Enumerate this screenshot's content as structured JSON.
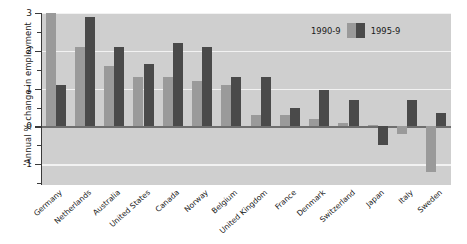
{
  "chart_data": {
    "type": "bar",
    "title": "",
    "xlabel": "",
    "ylabel": "Annual % change in employment",
    "ylim": [
      -1.55,
      3.0
    ],
    "yticks": [
      3,
      2,
      1,
      0,
      -1
    ],
    "ytick_labels": [
      "3",
      "2",
      "1",
      "0",
      "-1"
    ],
    "minor_ticks": [
      2.5,
      1.5,
      0.5,
      -0.5,
      -1.5
    ],
    "grid": true,
    "grid_axis": "y",
    "legend_position": "top-right",
    "categories": [
      "Germany",
      "Netherlands",
      "Australia",
      "United States",
      "Canada",
      "Norway",
      "Belgium",
      "United Kingdom",
      "France",
      "Denmark",
      "Switzerland",
      "Japan",
      "Italy",
      "Sweden"
    ],
    "series": [
      {
        "name": "1990-9",
        "color": "#9a9a9a",
        "values": [
          3.0,
          2.1,
          1.6,
          1.3,
          1.3,
          1.2,
          1.1,
          0.3,
          0.3,
          0.2,
          0.1,
          0.05,
          -0.2,
          -1.2
        ]
      },
      {
        "name": "1995-9",
        "color": "#4a4a4a",
        "values": [
          1.1,
          2.9,
          2.1,
          1.65,
          2.2,
          2.1,
          1.3,
          1.3,
          0.5,
          0.95,
          0.7,
          -0.5,
          0.7,
          0.35
        ]
      }
    ]
  },
  "legend": {
    "left_label": "1990-9",
    "right_label": "1995-9"
  },
  "style": {
    "plot_background": "#cfcfcf",
    "page_background": "#ffffff",
    "gridline_color": "#f2f2f2",
    "axis_color": "#3a3a3a",
    "zeroline_color": "#6e6e6e"
  }
}
